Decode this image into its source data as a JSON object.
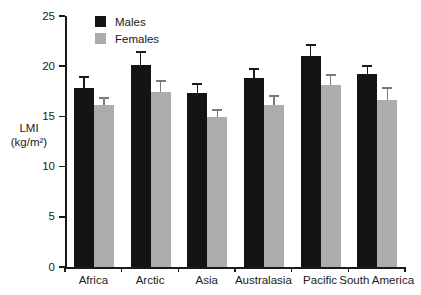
{
  "chart_data": {
    "type": "bar",
    "title": "",
    "xlabel": "",
    "ylabel_lines": [
      "LMI",
      "(kg/m²)"
    ],
    "categories": [
      "Africa",
      "Arctic",
      "Asia",
      "Australasia",
      "Pacific",
      "South America"
    ],
    "series": [
      {
        "name": "Males",
        "color": "#141414",
        "error_color": "#1a1a1a",
        "values": [
          17.8,
          20.1,
          17.3,
          18.8,
          21.0,
          19.2
        ],
        "errors_plus": [
          1.2,
          1.4,
          1.0,
          1.0,
          1.2,
          0.9
        ]
      },
      {
        "name": "Females",
        "color": "#acacac",
        "error_color": "#7a7a7a",
        "values": [
          16.1,
          17.4,
          14.9,
          16.1,
          18.1,
          16.6
        ],
        "errors_plus": [
          0.8,
          1.2,
          0.8,
          1.0,
          1.1,
          1.3
        ]
      }
    ],
    "yticks": [
      0,
      5,
      10,
      15,
      20,
      25
    ],
    "ylim": [
      0,
      25
    ],
    "grid": false,
    "legend_position": "top-left-inside",
    "axis_color": "#1a1a1a"
  }
}
